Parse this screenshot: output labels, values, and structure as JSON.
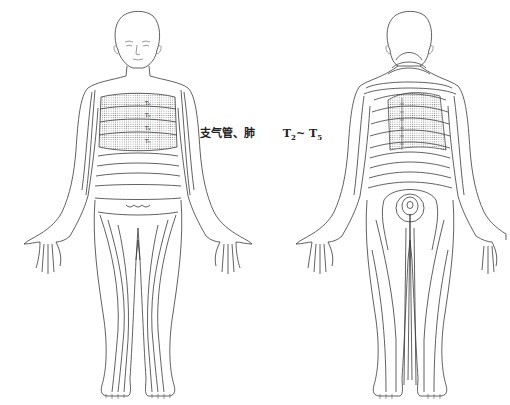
{
  "caption": {
    "organ": "支气管、肺",
    "range_start": "T",
    "range_start_sub": "2",
    "range_sep": "~ ",
    "range_end": "T",
    "range_end_sub": "5"
  },
  "front_figure": {
    "view": "anterior",
    "segment_labels": [
      "T2",
      "T3",
      "T4",
      "T5"
    ],
    "highlighted_region": "chest T2–T5 dermatome bands (dotted)"
  },
  "back_figure": {
    "view": "posterior",
    "highlighted_region": "upper back T2–T5 dermatome bands (dotted)"
  },
  "colors": {
    "line": "#3a3a3a",
    "fill_dots": "#8a8a8a",
    "background": "#ffffff"
  }
}
